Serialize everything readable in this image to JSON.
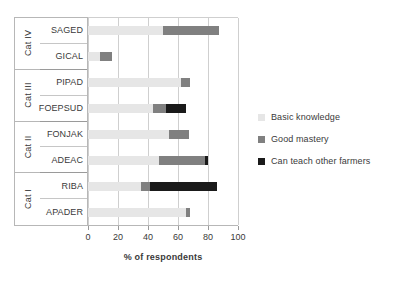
{
  "chart_data": {
    "type": "bar",
    "orientation": "horizontal",
    "stacked": true,
    "title": "",
    "xlabel": "% of respondents",
    "ylabel": "",
    "xlim": [
      0,
      100
    ],
    "xticks": [
      0,
      20,
      40,
      60,
      80,
      100
    ],
    "grid": true,
    "legend_position": "right",
    "categories": [
      "SAGED",
      "GICAL",
      "PIPAD",
      "FOEPSUD",
      "FONJAK",
      "ADEAC",
      "RIBA",
      "APADER"
    ],
    "groups": [
      {
        "label": "Cat IV",
        "members": [
          "SAGED",
          "GICAL"
        ]
      },
      {
        "label": "Cat III",
        "members": [
          "PIPAD",
          "FOEPSUD"
        ]
      },
      {
        "label": "Cat II",
        "members": [
          "FONJAK",
          "ADEAC"
        ]
      },
      {
        "label": "Cat I",
        "members": [
          "RIBA",
          "APADER"
        ]
      }
    ],
    "series": [
      {
        "name": "Basic knowledge",
        "color": "#e6e6e6",
        "values": [
          50,
          8,
          62,
          43,
          54,
          47,
          35,
          65
        ]
      },
      {
        "name": "Good mastery",
        "color": "#808080",
        "values": [
          37,
          8,
          6,
          9,
          13,
          31,
          6,
          3
        ]
      },
      {
        "name": "Can teach other farmers",
        "color": "#1a1a1a",
        "values": [
          0,
          0,
          0,
          13,
          0,
          2,
          45,
          0
        ]
      }
    ],
    "totals": [
      87,
      16,
      68,
      65,
      67,
      80,
      86,
      68
    ]
  },
  "legend": {
    "items": [
      {
        "label": "Basic knowledge",
        "color": "#e6e6e6"
      },
      {
        "label": "Good mastery",
        "color": "#808080"
      },
      {
        "label": "Can teach other farmers",
        "color": "#1a1a1a"
      }
    ]
  },
  "axis": {
    "x_title": "% of respondents",
    "x_tick_labels": [
      "0",
      "20",
      "40",
      "60",
      "80",
      "100"
    ]
  }
}
